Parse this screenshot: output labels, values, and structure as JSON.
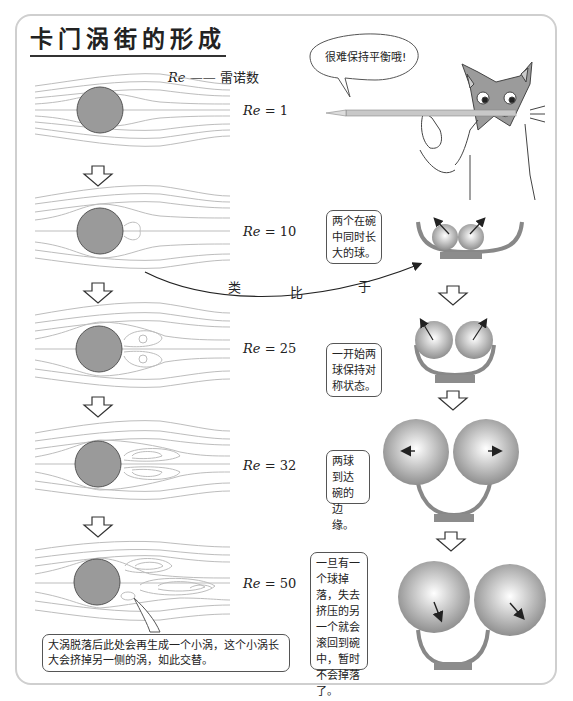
{
  "title": "卡门涡街的形成",
  "legend": {
    "symbol": "Re",
    "dash": "——",
    "meaning": "雷诺数"
  },
  "flow_stages": [
    {
      "re_symbol": "Re",
      "re_value": "= 1"
    },
    {
      "re_symbol": "Re",
      "re_value": "= 10"
    },
    {
      "re_symbol": "Re",
      "re_value": "= 25"
    },
    {
      "re_symbol": "Re",
      "re_value": "= 32"
    },
    {
      "re_symbol": "Re",
      "re_value": "= 50"
    }
  ],
  "cat_speech": "很难保持平衡哦!",
  "analogy_label": {
    "c1": "类",
    "c2": "比",
    "c3": "于"
  },
  "ball_notes": [
    "两个在碗中同时长大的球。",
    "一开始两球保持对称状态。",
    "两球到达碗的边缘。",
    "一旦有一个球掉落，失去挤压的另一个就会滚回到碗中，暂时不会掉落了。"
  ],
  "bottom_note": "大涡脱落后此处会再生成一个小涡，这个小涡长大会挤掉另一侧的涡，如此交替。",
  "colors": {
    "cylinder": "#9a9a9a",
    "streamline": "#bdbdbd",
    "bowl": "#8c8c8c",
    "frame": "#cfcfcf"
  }
}
